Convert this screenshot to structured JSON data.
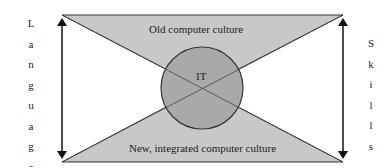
{
  "diagram": {
    "top_region": {
      "label": "Old computer culture"
    },
    "bottom_region": {
      "label": "New, integrated computer culture"
    },
    "center_circle": {
      "label": "IT"
    },
    "left_axis": {
      "label": "Language",
      "letters": [
        "L",
        "a",
        "n",
        "g",
        "u",
        "a",
        "g",
        "e"
      ]
    },
    "right_axis": {
      "label": "Skills",
      "letters": [
        "S",
        "k",
        "i",
        "l",
        "l",
        "s"
      ]
    },
    "colors": {
      "triangle_fill": "#c8c8c8",
      "circle_fill": "#a9a9a9",
      "stroke": "#222222",
      "background": "#ffffff"
    }
  }
}
